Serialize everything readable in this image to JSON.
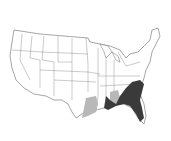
{
  "map": {
    "title": "Range map — southeastern United States",
    "region": "Contiguous United States with southern Canada",
    "legend": [
      {
        "label": "Primary range",
        "color": "#3a3a3a"
      },
      {
        "label": "Secondary / peripheral range",
        "color": "#b8b8b8"
      }
    ],
    "colors": {
      "background": "#ffffff",
      "land": "#ffffff",
      "borders": "#6a6a6a",
      "primary_range": "#3a3a3a",
      "secondary_range": "#b8b8b8"
    }
  }
}
